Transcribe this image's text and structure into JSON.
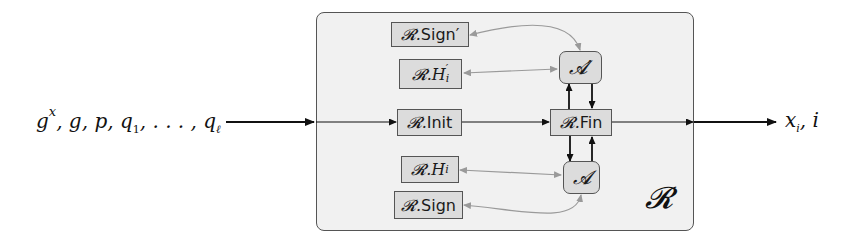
{
  "diagram": {
    "inputs_label": "g^x, g, p, q_1, …, q_ℓ",
    "inputs": {
      "gx": "g",
      "gx_sup": "x",
      "rest": ", g, p, q",
      "q1_sub": "1",
      "dots": ", . . . , q",
      "ql_sub": "ℓ"
    },
    "outputs_label": "x_i, i",
    "outputs": {
      "x": "x",
      "x_sub": "i",
      "rest": ", i"
    },
    "container": {
      "label": "𝓡",
      "name": "R"
    },
    "boxes": {
      "sign_prime": {
        "prefix": "𝓡.",
        "text": "Sign′"
      },
      "h_prime": {
        "prefix": "𝓡.",
        "text": "H",
        "sub": "i",
        "prime": "′"
      },
      "init": {
        "prefix": "𝓡.",
        "text": "Init"
      },
      "fin": {
        "prefix": "𝓡.",
        "text": "Fin"
      },
      "h": {
        "prefix": "𝓡.",
        "text": "H",
        "sub": "i"
      },
      "sign": {
        "prefix": "𝓡.",
        "text": "Sign"
      },
      "adversary_prime": {
        "text": "𝓐′"
      },
      "adversary": {
        "text": "𝓐"
      }
    },
    "colors": {
      "box_fill": "#dcdcdc",
      "container_fill": "#f1f1f1",
      "border": "#555555",
      "main_arrow": "#111111",
      "oracle_arrow": "#9a9a9a"
    }
  }
}
